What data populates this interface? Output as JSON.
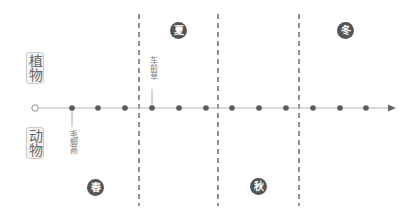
{
  "categories": {
    "plant": "植物",
    "animal": "动物"
  },
  "seasons": [
    {
      "label": "春",
      "x": 95,
      "y": 187
    },
    {
      "label": "夏",
      "x": 178,
      "y": 30
    },
    {
      "label": "秋",
      "x": 258,
      "y": 186
    },
    {
      "label": "冬",
      "x": 345,
      "y": 30
    }
  ],
  "events": [
    {
      "label": "车前草",
      "group": "植物",
      "dot_index": 3
    },
    {
      "label": "毛脚燕",
      "group": "动物",
      "dot_index": 0
    }
  ],
  "timeline": {
    "axis_y": 108,
    "start_x": 35,
    "dots_x": [
      72,
      98,
      125,
      152,
      179,
      206,
      232,
      259,
      286,
      313,
      340,
      366
    ],
    "dividers_x": [
      139,
      218,
      299
    ],
    "arrow_x": 393
  },
  "colors": {
    "axis": "#b5b5b5",
    "dot": "#5a5a5a",
    "divider": "#555555",
    "season_fill": "#555555"
  }
}
